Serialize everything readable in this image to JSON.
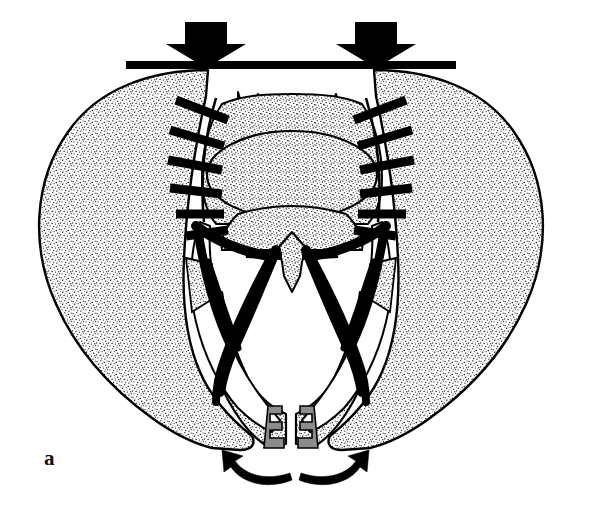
{
  "figure": {
    "panel_label": "a",
    "background_color": "#ffffff",
    "ink_color": "#000000",
    "stipple_color": "#1a1a1a",
    "cartilage_color": "#8c8c8c",
    "bone_fill": "#f7f7f4"
  },
  "annotations": {
    "compression_bar": {
      "name": "horizontal-compression-bar",
      "label": "compression bar",
      "x1": 126,
      "x2": 456,
      "y": 62,
      "thickness": 8
    },
    "force_arrows": [
      {
        "name": "left-force-arrow",
        "label": "downward compressive force (left)",
        "direction": "down",
        "tip_x": 206,
        "tip_y": 68
      },
      {
        "name": "right-force-arrow",
        "label": "downward compressive force (right)",
        "direction": "down",
        "tip_x": 376,
        "tip_y": 68
      }
    ],
    "rotation_arrows": [
      {
        "name": "left-external-rotation-arrow",
        "label": "external rotation (left hemipelvis)",
        "direction": "counter-clockwise"
      },
      {
        "name": "right-external-rotation-arrow",
        "label": "external rotation (right hemipelvis)",
        "direction": "clockwise"
      }
    ]
  },
  "anatomy": {
    "structures": [
      {
        "name": "left-iliac-wing",
        "label": "Left ilium",
        "fill": "stipple"
      },
      {
        "name": "right-iliac-wing",
        "label": "Right ilium",
        "fill": "stipple"
      },
      {
        "name": "sacrum-body",
        "label": "Sacrum",
        "fill": "stipple"
      },
      {
        "name": "sacral-oval",
        "label": "S1 vertebral body",
        "fill": "stipple"
      },
      {
        "name": "l5-transverse-processes",
        "label": "L5 / sacral processes",
        "fill": "stipple"
      },
      {
        "name": "coccyx",
        "label": "Coccyx",
        "fill": "stipple"
      },
      {
        "name": "left-pubic-ramus",
        "label": "Left pubic ramus",
        "fill": "stipple"
      },
      {
        "name": "right-pubic-ramus",
        "label": "Right pubic ramus",
        "fill": "stipple"
      },
      {
        "name": "left-acetabulum",
        "label": "Left acetabulum region",
        "fill": "white"
      },
      {
        "name": "right-acetabulum",
        "label": "Right acetabulum region",
        "fill": "white"
      }
    ],
    "ligaments": [
      {
        "name": "left-sacroiliac-ligaments",
        "label": "Left posterior sacroiliac ligaments",
        "style": "ladder-rungs",
        "count": 6
      },
      {
        "name": "right-sacroiliac-ligaments",
        "label": "Right posterior sacroiliac ligaments",
        "style": "ladder-rungs",
        "count": 6
      },
      {
        "name": "left-sacrospinous-ligament",
        "label": "Left sacrospinous ligament",
        "style": "solid-band"
      },
      {
        "name": "right-sacrospinous-ligament",
        "label": "Right sacrospinous ligament",
        "style": "solid-band"
      },
      {
        "name": "left-sacrotuberous-ligament",
        "label": "Left sacrotuberous ligament",
        "style": "solid-band"
      },
      {
        "name": "right-sacrotuberous-ligament",
        "label": "Right sacrotuberous ligament",
        "style": "solid-band"
      }
    ],
    "symphysis": {
      "name": "pubic-symphysis-diastasis",
      "label": "Pubic symphysis diastasis (open book)",
      "gap_px": 26,
      "teeth_per_side": 3,
      "surface_color": "#8c8c8c"
    }
  }
}
